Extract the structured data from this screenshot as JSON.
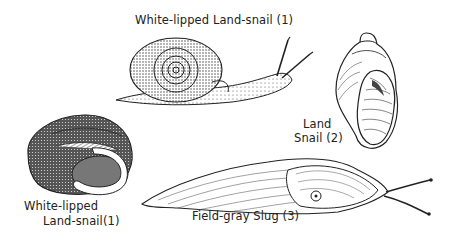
{
  "illustration": {
    "subjects": [
      {
        "id": "top-snail",
        "label": "White-lipped Land-snail (1)",
        "drawing": "snail-side-view-icon"
      },
      {
        "id": "left-shell",
        "label_line1": "White-lipped",
        "label_line2": "Land-snail(1)",
        "drawing": "snail-shell-aperture-icon"
      },
      {
        "id": "right-shell",
        "label_line1": "Land",
        "label_line2": "Snail (2)",
        "drawing": "elongated-shell-icon"
      },
      {
        "id": "slug",
        "label": "Field-gray Slug (3)",
        "drawing": "slug-icon"
      }
    ],
    "colors": {
      "ink": "#1a1a1a",
      "background": "#ffffff",
      "shade": "#8a8a8a"
    }
  }
}
